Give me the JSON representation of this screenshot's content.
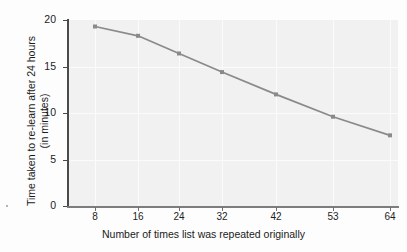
{
  "chart_data": {
    "type": "line",
    "title": "",
    "xlabel": "Number of times list was repeated originally",
    "ylabel": "Time taken to re-learn after 24 hours\n(in minutes)",
    "ylabel_line1": "Time taken to re-learn after 24 hours",
    "ylabel_line2": "(in minutes)",
    "categories": [
      "8",
      "16",
      "24",
      "32",
      "42",
      "53",
      "64"
    ],
    "x": [
      8,
      16,
      24,
      32,
      42,
      53,
      64
    ],
    "values": [
      19.3,
      18.3,
      16.4,
      14.4,
      12.0,
      9.6,
      7.6
    ],
    "series": [
      {
        "name": "Time to re-learn",
        "values": [
          19.3,
          18.3,
          16.4,
          14.4,
          12.0,
          9.6,
          7.6
        ]
      }
    ],
    "xtick_labels": [
      "8",
      "16",
      "24",
      "32",
      "42",
      "53",
      "64"
    ],
    "ytick_labels": [
      "0",
      "5",
      "10",
      "15",
      "20"
    ],
    "yticks": [
      0,
      5,
      10,
      15,
      20
    ],
    "ylim": [
      0,
      20
    ],
    "grid": true,
    "legend": "none",
    "line_color": "#8a8a8a",
    "marker_color": "#8a8a8a",
    "panel_color": "#f1f1f1",
    "grid_color": "#fbfbfb",
    "axis_color": "#4a4a4a"
  }
}
